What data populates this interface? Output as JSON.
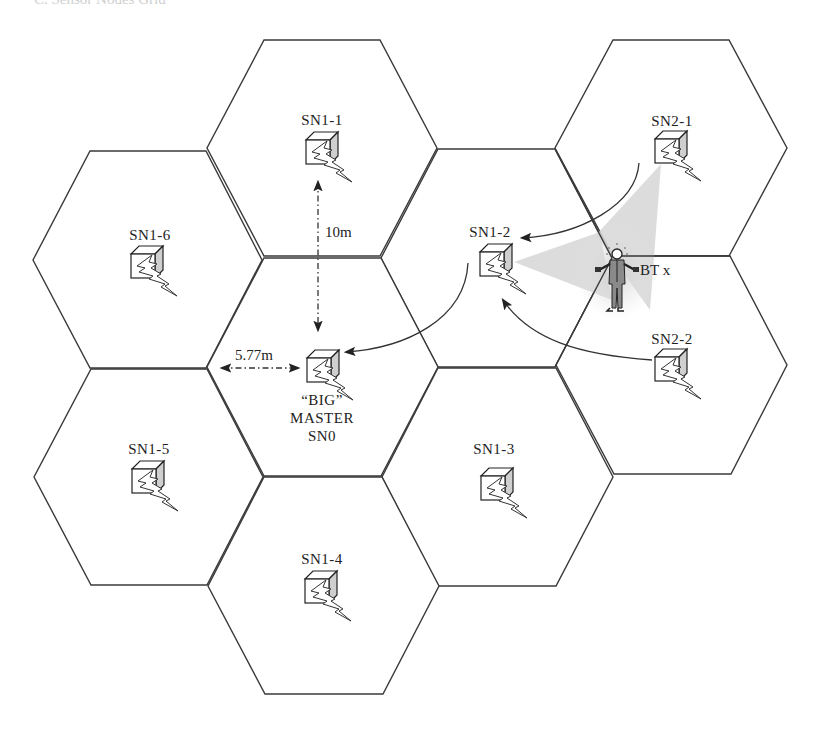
{
  "caption": "C. Sensor Nodes Grid",
  "cells": [
    {
      "id": "SN1-1",
      "label": "SN1-1",
      "cx": 322,
      "cy": 148
    },
    {
      "id": "SN1-6",
      "label": "SN1-6",
      "cx": 148,
      "cy": 260
    },
    {
      "id": "SN1-2",
      "label": "SN1-2",
      "cx": 496,
      "cy": 258
    },
    {
      "id": "SN2-1",
      "label": "SN2-1",
      "cx": 671,
      "cy": 148
    },
    {
      "id": "SN0",
      "label": "SN0",
      "cx": 322,
      "cy": 367
    },
    {
      "id": "SN2-2",
      "label": "SN2-2",
      "cx": 671,
      "cy": 365
    },
    {
      "id": "SN1-5",
      "label": "SN1-5",
      "cx": 148,
      "cy": 477
    },
    {
      "id": "SN1-3",
      "label": "SN1-3",
      "cx": 497,
      "cy": 477
    },
    {
      "id": "SN1-4",
      "label": "SN1-4",
      "cx": 323,
      "cy": 586
    }
  ],
  "master": {
    "line1": "“BIG”",
    "line2": "MASTER",
    "line3": "SN0"
  },
  "dimensions": {
    "vertical": "10m",
    "horizontal": "5.77m"
  },
  "mobile_node": {
    "label": "BT x"
  },
  "colors": {
    "line": "#3a3a3a",
    "cone": "#d9d9d9",
    "background": "#ffffff"
  }
}
